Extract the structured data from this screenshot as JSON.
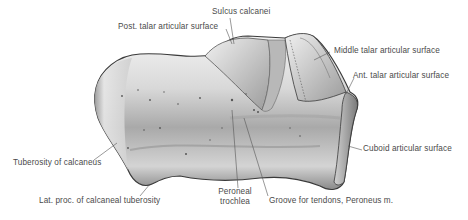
{
  "figure": {
    "labels": {
      "sulcus_calcanei": "Sulcus calcanei",
      "post_talar": "Post. talar articular surface",
      "middle_talar": "Middle talar articular surface",
      "ant_talar": "Ant. talar articular surface",
      "tuberosity": "Tuberosity of calcaneus",
      "cuboid": "Cuboid articular surface",
      "lat_proc": "Lat. proc. of calcaneal tuberosity",
      "peroneal_line1": "Peroneal",
      "peroneal_line2": "trochlea",
      "groove": "Groove for tendons, Peroneus m."
    },
    "colors": {
      "bone_light": "#f2f2f2",
      "bone_mid": "#c8c8c8",
      "bone_dark": "#6e6e6e",
      "outline": "#3a3a3a",
      "leader": "#555555",
      "text": "#4a4a4a"
    }
  }
}
